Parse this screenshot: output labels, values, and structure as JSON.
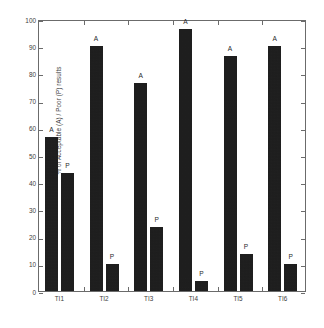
{
  "chart_data": {
    "type": "bar",
    "title": "",
    "xlabel": "",
    "ylabel": "% of Acceptable (A) / Poor (P) results",
    "ylim": [
      0,
      100
    ],
    "ytick_labels": [
      "0",
      "10",
      "20",
      "30",
      "40",
      "50",
      "60",
      "70",
      "80",
      "90",
      "100"
    ],
    "ytick_values": [
      0,
      10,
      20,
      30,
      40,
      50,
      60,
      70,
      80,
      90,
      100
    ],
    "grid": false,
    "legend_position": "none",
    "categories": [
      "TI1",
      "TI2",
      "TI3",
      "TI4",
      "TI5",
      "TI6"
    ],
    "series": [
      {
        "name": "Acceptable (A)",
        "point_label": "A",
        "values": [
          56.5,
          90.0,
          76.5,
          96.5,
          86.5,
          90.0
        ]
      },
      {
        "name": "Poor (P)",
        "point_label": "P",
        "values": [
          43.5,
          10.0,
          23.5,
          3.5,
          13.5,
          10.0
        ]
      }
    ],
    "bar_color": "#151515",
    "axis_color": "#6b6b6b",
    "text_color": "#3c3c3c",
    "background_color": "#ffffff"
  }
}
